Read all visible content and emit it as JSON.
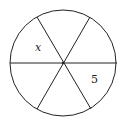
{
  "diagram": {
    "type": "circle-divided-into-sectors",
    "sector_count": 6,
    "line_color": "#222222",
    "background": "#ffffff",
    "circle": {
      "cx": 63,
      "cy": 63,
      "r": 53
    },
    "diameters": [
      {
        "x1": 10,
        "y1": 63,
        "x2": 117,
        "y2": 63
      },
      {
        "x1": 37,
        "y1": 17,
        "x2": 91,
        "y2": 109
      },
      {
        "x1": 90,
        "y1": 17,
        "x2": 37,
        "y2": 109
      }
    ],
    "labels": [
      {
        "id": "x",
        "text": "x",
        "x": 35,
        "y": 51,
        "italic": true
      },
      {
        "id": "five",
        "text": "5",
        "x": 91,
        "y": 83,
        "italic": false
      }
    ]
  }
}
